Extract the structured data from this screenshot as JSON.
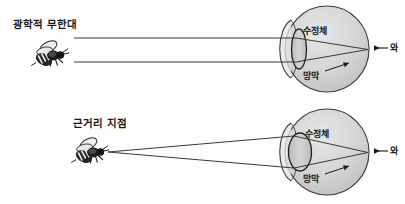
{
  "figure": {
    "background_color": "#fdfdfd",
    "ink_color": "#1a1a1a",
    "eye_fill_color": "#d2d2d2",
    "eye_fill_color_light": "#e2e2e2",
    "lens_fill_color": "#c6c6c6",
    "ray_color": "#3a3a3a"
  },
  "panels": [
    {
      "id": "far",
      "scene_label": "광학적 무한대",
      "lens_label": "수정체",
      "retina_label": "망막",
      "fovea_label": "와",
      "ray_type": "parallel",
      "object_icon": "bee-icon"
    },
    {
      "id": "near",
      "scene_label": "근거리 지점",
      "lens_label": "수정체",
      "retina_label": "망막",
      "fovea_label": "와",
      "ray_type": "divergent",
      "object_icon": "bee-icon"
    }
  ]
}
